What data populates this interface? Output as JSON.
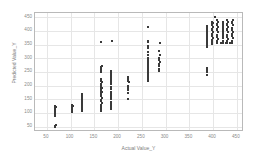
{
  "chart_data": {
    "type": "scatter",
    "title": "",
    "xlabel": "Actual Value_Y",
    "ylabel": "Predicted Value_Y",
    "xlim": [
      25,
      465
    ],
    "ylim": [
      30,
      465
    ],
    "xticks": [
      50,
      100,
      150,
      200,
      250,
      300,
      350,
      400,
      450
    ],
    "yticks": [
      50,
      100,
      150,
      200,
      250,
      300,
      350,
      400,
      450
    ],
    "grid": true,
    "legend": false,
    "marker_color": "#3a3a3a",
    "marker": "square",
    "series": [
      {
        "name": "predictions",
        "points": [
          [
            68,
            50
          ],
          [
            68,
            52
          ],
          [
            69,
            55
          ],
          [
            68,
            88
          ],
          [
            68,
            92
          ],
          [
            68,
            96
          ],
          [
            68,
            100
          ],
          [
            68,
            104
          ],
          [
            68,
            108
          ],
          [
            68,
            112
          ],
          [
            68,
            116
          ],
          [
            68,
            120
          ],
          [
            69,
            122
          ],
          [
            68,
            124
          ],
          [
            103,
            103
          ],
          [
            103,
            107
          ],
          [
            103,
            112
          ],
          [
            103,
            116
          ],
          [
            103,
            120
          ],
          [
            104,
            124
          ],
          [
            103,
            128
          ],
          [
            123,
            108
          ],
          [
            123,
            113
          ],
          [
            123,
            118
          ],
          [
            123,
            123
          ],
          [
            123,
            128
          ],
          [
            123,
            133
          ],
          [
            123,
            138
          ],
          [
            123,
            143
          ],
          [
            123,
            148
          ],
          [
            123,
            152
          ],
          [
            123,
            157
          ],
          [
            123,
            162
          ],
          [
            123,
            166
          ],
          [
            124,
            170
          ],
          [
            164,
            108
          ],
          [
            164,
            113
          ],
          [
            164,
            118
          ],
          [
            164,
            124
          ],
          [
            164,
            130
          ],
          [
            165,
            136
          ],
          [
            164,
            142
          ],
          [
            164,
            148
          ],
          [
            165,
            154
          ],
          [
            164,
            160
          ],
          [
            164,
            166
          ],
          [
            164,
            172
          ],
          [
            165,
            176
          ],
          [
            164,
            180
          ],
          [
            164,
            184
          ],
          [
            164,
            188
          ],
          [
            165,
            192
          ],
          [
            164,
            196
          ],
          [
            164,
            200
          ],
          [
            164,
            206
          ],
          [
            165,
            212
          ],
          [
            164,
            218
          ],
          [
            164,
            224
          ],
          [
            164,
            248
          ],
          [
            164,
            254
          ],
          [
            164,
            260
          ],
          [
            164,
            266
          ],
          [
            165,
            272
          ],
          [
            163,
            360
          ],
          [
            184,
            116
          ],
          [
            184,
            122
          ],
          [
            184,
            128
          ],
          [
            185,
            134
          ],
          [
            184,
            140
          ],
          [
            184,
            150
          ],
          [
            185,
            158
          ],
          [
            184,
            166
          ],
          [
            184,
            172
          ],
          [
            185,
            178
          ],
          [
            184,
            186
          ],
          [
            184,
            196
          ],
          [
            185,
            204
          ],
          [
            184,
            212
          ],
          [
            184,
            218
          ],
          [
            185,
            224
          ],
          [
            184,
            230
          ],
          [
            184,
            236
          ],
          [
            185,
            242
          ],
          [
            184,
            248
          ],
          [
            184,
            254
          ],
          [
            186,
            362
          ],
          [
            221,
            152
          ],
          [
            221,
            172
          ],
          [
            221,
            182
          ],
          [
            221,
            192
          ],
          [
            221,
            200
          ],
          [
            222,
            212
          ],
          [
            221,
            218
          ],
          [
            221,
            224
          ],
          [
            221,
            230
          ],
          [
            262,
            218
          ],
          [
            262,
            224
          ],
          [
            262,
            230
          ],
          [
            263,
            236
          ],
          [
            262,
            242
          ],
          [
            262,
            248
          ],
          [
            263,
            254
          ],
          [
            262,
            260
          ],
          [
            262,
            266
          ],
          [
            263,
            274
          ],
          [
            262,
            282
          ],
          [
            262,
            290
          ],
          [
            263,
            296
          ],
          [
            262,
            302
          ],
          [
            262,
            310
          ],
          [
            263,
            322
          ],
          [
            262,
            336
          ],
          [
            263,
            344
          ],
          [
            262,
            358
          ],
          [
            263,
            362
          ],
          [
            262,
            414
          ],
          [
            286,
            254
          ],
          [
            286,
            262
          ],
          [
            286,
            270
          ],
          [
            286,
            278
          ],
          [
            287,
            286
          ],
          [
            286,
            294
          ],
          [
            286,
            302
          ],
          [
            287,
            310
          ],
          [
            286,
            328
          ],
          [
            287,
            356
          ],
          [
            387,
            240
          ],
          [
            387,
            248
          ],
          [
            387,
            256
          ],
          [
            387,
            264
          ],
          [
            387,
            340
          ],
          [
            387,
            348
          ],
          [
            387,
            356
          ],
          [
            388,
            362
          ],
          [
            387,
            368
          ],
          [
            387,
            374
          ],
          [
            388,
            380
          ],
          [
            387,
            386
          ],
          [
            387,
            392
          ],
          [
            388,
            398
          ],
          [
            387,
            404
          ],
          [
            387,
            410
          ],
          [
            388,
            416
          ],
          [
            398,
            352
          ],
          [
            398,
            360
          ],
          [
            398,
            368
          ],
          [
            399,
            374
          ],
          [
            398,
            382
          ],
          [
            398,
            390
          ],
          [
            399,
            396
          ],
          [
            398,
            402
          ],
          [
            398,
            408
          ],
          [
            399,
            414
          ],
          [
            398,
            420
          ],
          [
            398,
            424
          ],
          [
            399,
            428
          ],
          [
            398,
            432
          ],
          [
            409,
            356
          ],
          [
            409,
            362
          ],
          [
            410,
            370
          ],
          [
            409,
            378
          ],
          [
            409,
            386
          ],
          [
            410,
            394
          ],
          [
            409,
            402
          ],
          [
            409,
            408
          ],
          [
            410,
            414
          ],
          [
            409,
            420
          ],
          [
            409,
            426
          ],
          [
            410,
            432
          ],
          [
            409,
            438
          ],
          [
            404,
            450
          ],
          [
            420,
            356
          ],
          [
            420,
            364
          ],
          [
            421,
            372
          ],
          [
            420,
            380
          ],
          [
            420,
            388
          ],
          [
            421,
            396
          ],
          [
            420,
            402
          ],
          [
            420,
            408
          ],
          [
            421,
            414
          ],
          [
            420,
            420
          ],
          [
            420,
            426
          ],
          [
            421,
            432
          ],
          [
            430,
            356
          ],
          [
            430,
            362
          ],
          [
            431,
            370
          ],
          [
            430,
            378
          ],
          [
            430,
            386
          ],
          [
            431,
            394
          ],
          [
            430,
            402
          ],
          [
            430,
            408
          ],
          [
            431,
            414
          ],
          [
            430,
            420
          ],
          [
            430,
            426
          ],
          [
            431,
            432
          ],
          [
            430,
            438
          ],
          [
            440,
            356
          ],
          [
            440,
            364
          ],
          [
            441,
            372
          ],
          [
            440,
            380
          ],
          [
            440,
            388
          ],
          [
            441,
            396
          ],
          [
            440,
            404
          ],
          [
            440,
            412
          ],
          [
            441,
            420
          ],
          [
            440,
            428
          ],
          [
            440,
            434
          ],
          [
            441,
            440
          ],
          [
            436,
            356
          ],
          [
            426,
            356
          ],
          [
            416,
            356
          ]
        ]
      }
    ]
  },
  "axes": {
    "x_title": "Actual Value_Y",
    "y_title": "Predicted Value_Y",
    "x_tick_labels": [
      "50",
      "100",
      "150",
      "200",
      "250",
      "300",
      "350",
      "400",
      "450"
    ],
    "y_tick_labels": [
      "450",
      "400",
      "350",
      "300",
      "250",
      "200",
      "150",
      "100",
      "50"
    ]
  }
}
